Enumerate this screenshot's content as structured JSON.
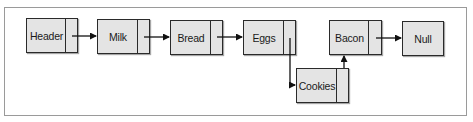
{
  "diagram": {
    "type": "linked-list",
    "nodes": [
      {
        "id": "header",
        "label": "Header",
        "x": 26,
        "y": 18,
        "w": 52,
        "pointer_w": 11
      },
      {
        "id": "milk",
        "label": "Milk",
        "x": 97,
        "y": 19,
        "w": 53,
        "pointer_w": 11
      },
      {
        "id": "bread",
        "label": "Bread",
        "x": 170,
        "y": 20,
        "w": 53,
        "pointer_w": 11
      },
      {
        "id": "eggs",
        "label": "Eggs",
        "x": 243,
        "y": 20,
        "w": 53,
        "pointer_w": 11
      },
      {
        "id": "cookies",
        "label": "Cookies",
        "x": 296,
        "y": 68,
        "w": 53,
        "pointer_w": 11
      },
      {
        "id": "bacon",
        "label": "Bacon",
        "x": 329,
        "y": 20,
        "w": 53,
        "pointer_w": 12
      },
      {
        "id": "null",
        "label": "Null",
        "x": 402,
        "y": 21,
        "w": 42,
        "pointer_w": 0
      }
    ],
    "edges": [
      {
        "from": "header",
        "to": "milk"
      },
      {
        "from": "milk",
        "to": "bread"
      },
      {
        "from": "bread",
        "to": "eggs"
      },
      {
        "from": "eggs",
        "to": "cookies"
      },
      {
        "from": "cookies",
        "to": "bacon"
      },
      {
        "from": "bacon",
        "to": "null"
      }
    ]
  },
  "colors": {
    "node_fill": "#e4e4e4",
    "node_border": "#2a2a2a",
    "frame_border": "#9a9a9a"
  }
}
